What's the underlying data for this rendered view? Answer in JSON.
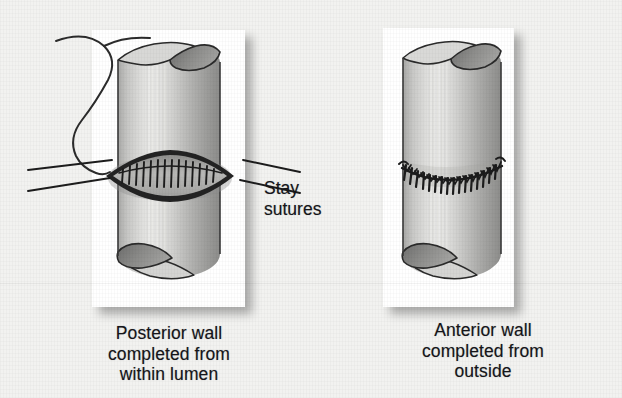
{
  "figure": {
    "background_color": "#f2f2f0",
    "panel_background": "#ffffff",
    "ink_color": "#15151a",
    "tissue_light": "#e4e4e2",
    "tissue_mid": "#c3c3c1",
    "tissue_dark": "#8d8d8c",
    "lumen_dark": "#6f6f6e"
  },
  "annotations": {
    "stay_sutures_label": "Stay\nsutures"
  },
  "panels": [
    {
      "id": "posterior",
      "caption": "Posterior wall\ncompleted from\nwithin lumen",
      "description": "Cut tube with open lens-shaped defect, completed posterior suture row inside the lumen, free suture thread looping from upper left, four stay-suture leader lines"
    },
    {
      "id": "anterior",
      "caption": "Anterior wall\ncompleted from\noutside",
      "description": "Intact tube with a circumferential running suture line completed from the outside"
    }
  ]
}
